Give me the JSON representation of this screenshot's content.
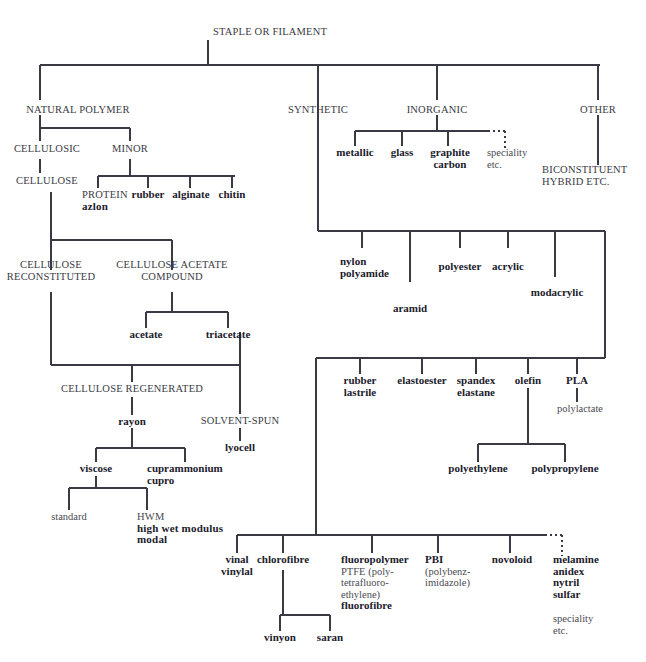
{
  "diagram": {
    "title": "STAPLE OR FILAMENT",
    "type": "taxonomy-tree",
    "colors": {
      "line": "#3a3a44",
      "text": "#2b2b33",
      "caps_text": "#3a3a44",
      "plain_text": "#4a4a52",
      "background": "#ffffff"
    },
    "nodes": {
      "root": "STAPLE OR FILAMENT",
      "natural_polymer": "NATURAL POLYMER",
      "synthetic": "SYNTHETIC",
      "inorganic": "INORGANIC",
      "other": "OTHER",
      "biconstituent": "BICONSTITUENT\nHYBRID ETC.",
      "biconstituent_l1": "BICONSTITUENT",
      "biconstituent_l2": "HYBRID ETC.",
      "cellulosic": "CELLULOSIC",
      "minor": "MINOR",
      "cellulose": "CELLULOSE",
      "protein": "PROTEIN",
      "azlon": "azlon",
      "rubber": "rubber",
      "alginate": "alginate",
      "chitin": "chitin",
      "metallic": "metallic",
      "glass": "glass",
      "graphite": "graphite",
      "carbon": "carbon",
      "speciality_inorganic_l1": "speciality",
      "speciality_inorganic_l2": "etc.",
      "cellulose_reconstituted_l1": "CELLULOSE",
      "cellulose_reconstituted_l2": "RECONSTITUTED",
      "cellulose_acetate_l1": "CELLULOSE ACETATE",
      "cellulose_acetate_l2": "COMPOUND",
      "acetate": "acetate",
      "triacetate": "triacetate",
      "cellulose_regenerated": "CELLULOSE REGENERATED",
      "solvent_spun": "SOLVENT-SPUN",
      "lyocell": "lyocell",
      "rayon": "rayon",
      "viscose": "viscose",
      "cuprammonium_l1": "cuprammonium",
      "cuprammonium_l2": "cupro",
      "standard": "standard",
      "hwm_l1": "HWM",
      "hwm_l2": "high wet modulus",
      "hwm_l3": "modal",
      "nylon_l1": "nylon",
      "nylon_l2": "polyamide",
      "aramid": "aramid",
      "polyester": "polyester",
      "acrylic": "acrylic",
      "modacrylic": "modacrylic",
      "rubber_l1": "rubber",
      "rubber_l2": "lastrile",
      "elastoester": "elastoester",
      "spandex_l1": "spandex",
      "spandex_l2": "elastane",
      "olefin": "olefin",
      "pla": "PLA",
      "polylactate": "polylactate",
      "polyethylene": "polyethylene",
      "polypropylene": "polypropylene",
      "vinal_l1": "vinal",
      "vinal_l2": "vinylal",
      "chlorofibre": "chlorofibre",
      "vinyon": "vinyon",
      "saran": "saran",
      "fluoropolymer": "fluoropolymer",
      "ptfe_l1": "PTFE (poly-",
      "ptfe_l2": "tetrafluoro-",
      "ptfe_l3": "ethylene)",
      "fluorofibre": "fluorofibre",
      "pbi": "PBI",
      "pbi_l1": "(polybenz-",
      "pbi_l2": "imidazole)",
      "novoloid": "novoloid",
      "melamine": "melamine",
      "anidex": "anidex",
      "nytril": "nytril",
      "sulfar": "sulfar",
      "speciality_other_l1": "speciality",
      "speciality_other_l2": "etc."
    }
  }
}
